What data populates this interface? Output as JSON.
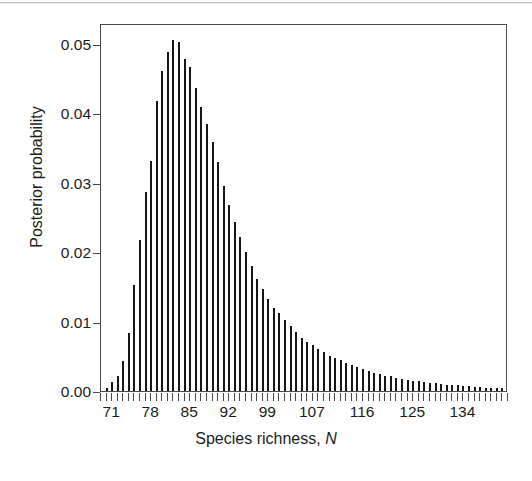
{
  "figure": {
    "background_color": "#ffffff",
    "axis_color": "#4a4a4a",
    "bar_color": "#161616",
    "text_color": "#1c1c1c"
  },
  "axes": {
    "y_title": "Posterior probability",
    "x_title_prefix": "Species richness, ",
    "x_title_variable": "N",
    "y_tick_labels": [
      "0.05",
      "0.04",
      "0.03",
      "0.02",
      "0.01",
      "0.00"
    ],
    "x_tick_labels": [
      "71",
      "78",
      "85",
      "92",
      "99",
      "107",
      "116",
      "125",
      "134"
    ]
  },
  "chart_data": {
    "type": "bar",
    "title": "",
    "subtitle": "",
    "xlabel": "Species richness, N",
    "ylabel": "Posterior probability",
    "xlim": [
      69,
      142
    ],
    "ylim": [
      0,
      0.053
    ],
    "grid": false,
    "legend": "none",
    "y_ticks": [
      0.05,
      0.04,
      0.03,
      0.02,
      0.01,
      0.0
    ],
    "x_ticks": [
      71,
      78,
      85,
      92,
      99,
      107,
      116,
      125,
      134
    ],
    "x_minor_tick_step": 1,
    "categories": [
      70,
      71,
      72,
      73,
      74,
      75,
      76,
      77,
      78,
      79,
      80,
      81,
      82,
      83,
      84,
      85,
      86,
      87,
      88,
      89,
      90,
      91,
      92,
      93,
      94,
      95,
      96,
      97,
      98,
      99,
      100,
      101,
      102,
      103,
      104,
      105,
      106,
      107,
      108,
      109,
      110,
      111,
      112,
      113,
      114,
      115,
      116,
      117,
      118,
      119,
      120,
      121,
      122,
      123,
      124,
      125,
      126,
      127,
      128,
      129,
      130,
      131,
      132,
      133,
      134,
      135,
      136,
      137,
      138,
      139,
      140,
      141
    ],
    "values": [
      0.0004,
      0.0013,
      0.0022,
      0.0043,
      0.0084,
      0.0152,
      0.0217,
      0.0286,
      0.0331,
      0.0417,
      0.0461,
      0.0488,
      0.0505,
      0.0502,
      0.0478,
      0.0466,
      0.0437,
      0.0409,
      0.0385,
      0.0358,
      0.033,
      0.0295,
      0.0268,
      0.0243,
      0.0222,
      0.02,
      0.018,
      0.0161,
      0.0147,
      0.0132,
      0.012,
      0.0112,
      0.0102,
      0.0094,
      0.0085,
      0.0077,
      0.0071,
      0.0066,
      0.006,
      0.0056,
      0.0051,
      0.0047,
      0.0044,
      0.004,
      0.0037,
      0.0034,
      0.0031,
      0.0029,
      0.0026,
      0.0024,
      0.0022,
      0.0021,
      0.0019,
      0.0018,
      0.0016,
      0.0015,
      0.0014,
      0.0013,
      0.0012,
      0.0011,
      0.001,
      0.0009,
      0.0009,
      0.0008,
      0.0007,
      0.0007,
      0.0006,
      0.0006,
      0.0005,
      0.0005,
      0.0004,
      0.0004
    ],
    "peak": {
      "x": 82,
      "y": 0.0505
    },
    "shape": "right-skewed unimodal discrete posterior"
  }
}
